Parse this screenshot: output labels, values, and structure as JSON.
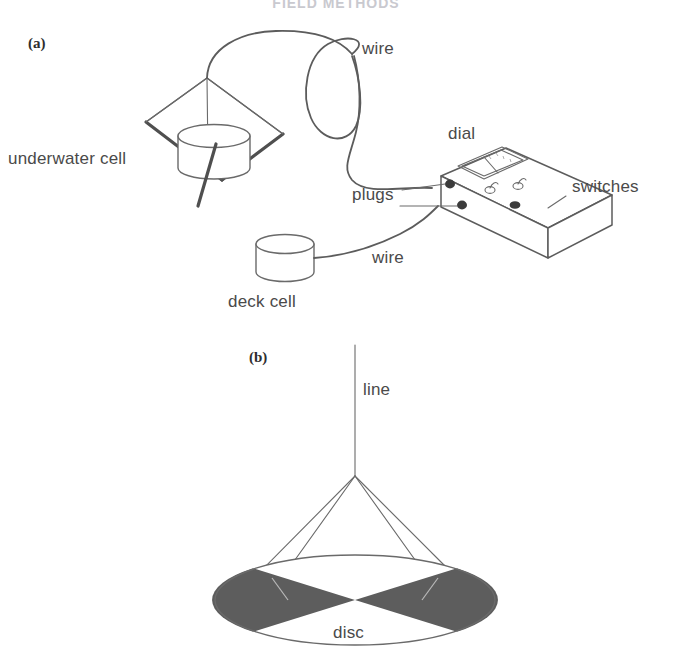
{
  "figure": {
    "title": "FIELD METHODS",
    "title_visible": "partially cropped at top edge",
    "background_color": "#ffffff",
    "ink_color": "#5c5c5c",
    "label_color": "#4a4a4a",
    "disc_fill_color": "#5d5d5d",
    "width": 673,
    "height": 659
  },
  "panels": [
    {
      "id": "a",
      "marker": "(a)",
      "name": "underwater-cell-apparatus",
      "labels": [
        {
          "key": "wire_top",
          "text": "wire",
          "x": 362,
          "y": 54
        },
        {
          "key": "underwater_cell",
          "text": "underwater cell",
          "x": 8,
          "y": 164
        },
        {
          "key": "dial",
          "text": "dial",
          "x": 448,
          "y": 139
        },
        {
          "key": "switches",
          "text": "switches",
          "x": 572,
          "y": 192
        },
        {
          "key": "plugs",
          "text": "plugs",
          "x": 352,
          "y": 200
        },
        {
          "key": "wire_bottom",
          "text": "wire",
          "x": 372,
          "y": 263
        },
        {
          "key": "deck_cell",
          "text": "deck cell",
          "x": 228,
          "y": 307
        }
      ],
      "components": [
        "underwater-cell-cylinder",
        "kite-frame",
        "suspension-rod",
        "coiled-wire",
        "deck-cell-cylinder",
        "deck-wire",
        "meter-box",
        "dial-meter",
        "toggle-switch-left",
        "toggle-switch-right",
        "knob-button",
        "plug-socket-upper",
        "plug-socket-lower"
      ],
      "meter_box": {
        "dial_needle_angle_deg": -32,
        "switch_count": 2,
        "knob_count": 1,
        "plug_count": 2
      }
    },
    {
      "id": "b",
      "marker": "(b)",
      "name": "secchi-disc",
      "labels": [
        {
          "key": "line",
          "text": "line",
          "x": 363,
          "y": 395
        },
        {
          "key": "disc",
          "text": "disc",
          "x": 333,
          "y": 638
        }
      ],
      "components": [
        "suspension-line",
        "bridle-lines",
        "secchi-disc-body",
        "disc-quadrant-dark-left",
        "disc-quadrant-dark-right",
        "disc-quadrant-white-top",
        "disc-quadrant-white-bottom"
      ],
      "disc": {
        "quadrants": 4,
        "dark_quadrants": [
          "left",
          "right"
        ],
        "light_quadrants": [
          "top",
          "bottom"
        ],
        "bridle_line_count": 4,
        "center_x": 355,
        "center_y": 600,
        "radius_x": 140,
        "radius_y": 45
      }
    }
  ]
}
